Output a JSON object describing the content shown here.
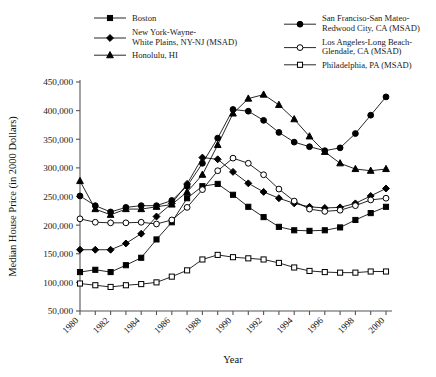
{
  "chart_data": {
    "type": "line",
    "title": "",
    "xlabel": "Year",
    "ylabel": "Median House Price (in 2000 Dollars)",
    "xlim": [
      1979.4,
      2000.6
    ],
    "ylim": [
      50000,
      450000
    ],
    "grid": false,
    "legend_position": "top",
    "x": [
      1980,
      1981,
      1982,
      1983,
      1984,
      1985,
      1986,
      1987,
      1988,
      1989,
      1990,
      1991,
      1992,
      1993,
      1994,
      1995,
      1996,
      1997,
      1998,
      1999,
      2000
    ],
    "ytick_labels": [
      "450,000",
      "400,000",
      "350,000",
      "300,000",
      "250,000",
      "200,000",
      "150,000",
      "100,000",
      "50,000"
    ],
    "ytick_values": [
      450000,
      400000,
      350000,
      300000,
      250000,
      200000,
      150000,
      100000,
      50000
    ],
    "xtick_labels": [
      "1980",
      "1982",
      "1984",
      "1986",
      "1988",
      "1990",
      "1992",
      "1994",
      "1996",
      "1998",
      "2000"
    ],
    "xtick_values": [
      1980,
      1982,
      1984,
      1986,
      1988,
      1990,
      1992,
      1994,
      1996,
      1998,
      2000
    ],
    "series": [
      {
        "name": "Boston",
        "marker": "filled-square",
        "values": [
          118000,
          122000,
          118000,
          130000,
          143000,
          175000,
          205000,
          247000,
          268000,
          272000,
          253000,
          232000,
          214000,
          197000,
          191000,
          190000,
          191000,
          196000,
          209000,
          221000,
          232000
        ]
      },
      {
        "name": "New York-Wayne-White Plains, NY-NJ (MSAD)",
        "marker": "filled-diamond",
        "values": [
          157000,
          157000,
          157000,
          168000,
          185000,
          215000,
          238000,
          272000,
          318000,
          315000,
          293000,
          273000,
          258000,
          247000,
          238000,
          232000,
          230000,
          231000,
          238000,
          251000,
          264000
        ]
      },
      {
        "name": "Honolulu, HI",
        "marker": "filled-triangle",
        "values": [
          277000,
          228000,
          218000,
          228000,
          228000,
          232000,
          236000,
          258000,
          288000,
          340000,
          395000,
          421000,
          428000,
          410000,
          385000,
          355000,
          328000,
          308000,
          298000,
          295000,
          298000
        ]
      },
      {
        "name": "San Francisco-San Mateo-Redwood City, CA (MSAD)",
        "marker": "filled-circle",
        "values": [
          251000,
          234000,
          223000,
          231000,
          234000,
          234000,
          243000,
          268000,
          308000,
          352000,
          402000,
          399000,
          383000,
          362000,
          345000,
          337000,
          330000,
          335000,
          360000,
          392000,
          424000
        ]
      },
      {
        "name": "Los Angeles-Long Beach-Glendale, CA (MSAD)",
        "marker": "open-circle",
        "values": [
          211000,
          205000,
          204000,
          204000,
          205000,
          202000,
          209000,
          231000,
          262000,
          295000,
          317000,
          308000,
          288000,
          263000,
          242000,
          228000,
          224000,
          226000,
          234000,
          244000,
          247000
        ]
      },
      {
        "name": "Philadelphia, PA (MSAD)",
        "marker": "open-square",
        "values": [
          98000,
          95000,
          92000,
          95000,
          97000,
          100000,
          110000,
          121000,
          140000,
          148000,
          144000,
          142000,
          140000,
          134000,
          126000,
          120000,
          118000,
          117000,
          117000,
          119000,
          119000
        ]
      }
    ]
  },
  "legend": {
    "left": [
      {
        "label": "Boston",
        "marker": "filled-square",
        "lines": [
          "Boston"
        ]
      },
      {
        "label": "New York-Wayne-White Plains, NY-NJ (MSAD)",
        "marker": "filled-diamond",
        "lines": [
          "New York-Wayne-",
          "White Plains, NY-NJ (MSAD)"
        ]
      },
      {
        "label": "Honolulu, HI",
        "marker": "filled-triangle",
        "lines": [
          "Honolulu, HI"
        ]
      }
    ],
    "right": [
      {
        "label": "San Francisco-San Mateo-Redwood City, CA (MSAD)",
        "marker": "filled-circle",
        "lines": [
          "San Franciso-San Mateo-",
          "Redwood City, CA (MSAD)"
        ]
      },
      {
        "label": "Los Angeles-Long Beach-Glendale, CA (MSAD)",
        "marker": "open-circle",
        "lines": [
          "Los Angeles-Long Beach-",
          "Glendale, CA (MSAD)"
        ]
      },
      {
        "label": "Philadelphia, PA (MSAD)",
        "marker": "open-square",
        "lines": [
          "Philadelphia, PA (MSAD)"
        ]
      }
    ]
  },
  "colors": {
    "line": "#000000",
    "text": "#1a1a1a",
    "axis": "#555555",
    "background": "#ffffff"
  }
}
